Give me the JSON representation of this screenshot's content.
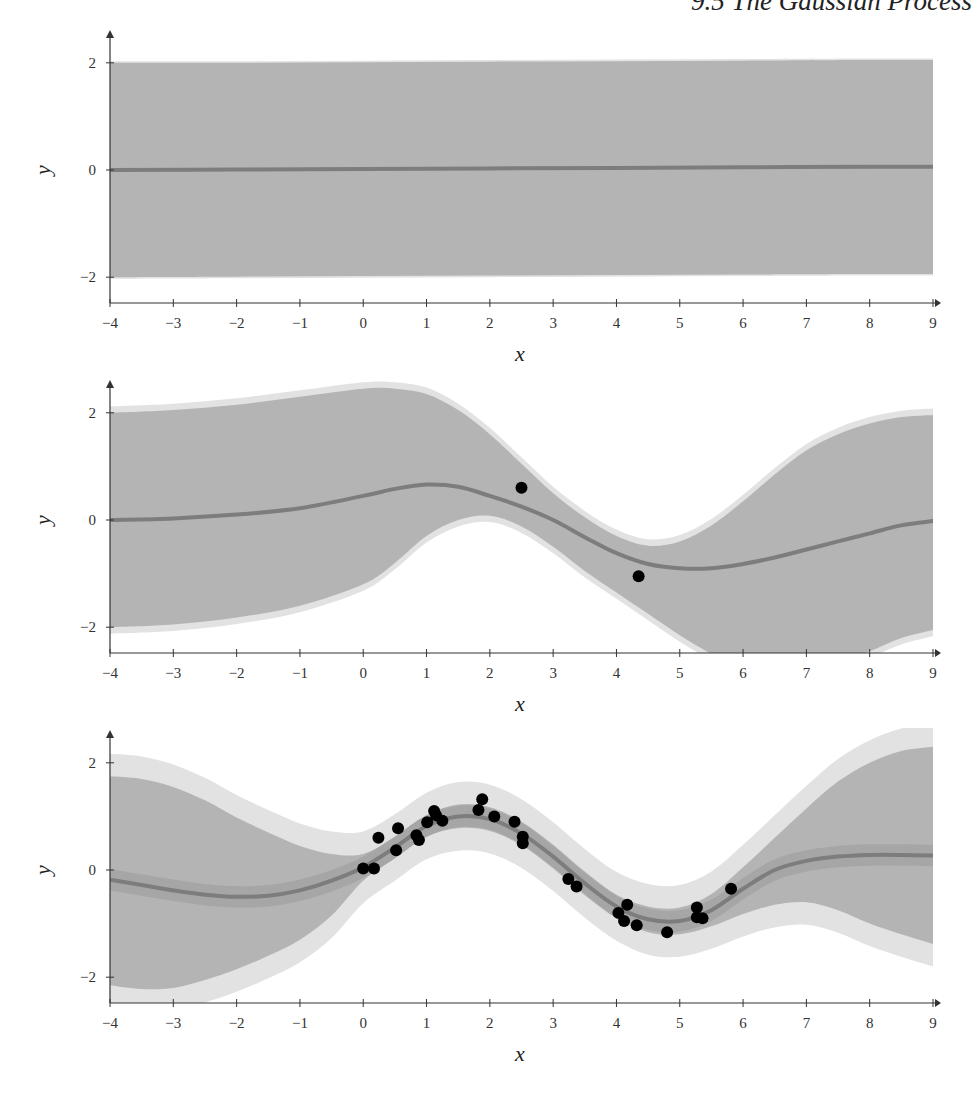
{
  "page": {
    "running_head": "9.5  The Gaussian Process"
  },
  "style": {
    "band_outer_color": "#e2e2e2",
    "band_inner_color": "#b4b4b4",
    "mean_color": "#7d7d7d",
    "point_color": "#000000",
    "axis_color": "#333333"
  },
  "chart_data": [
    {
      "type": "area",
      "title": "GP prior (no observations)",
      "xlabel": "x",
      "ylabel": "y",
      "xlim": [
        -4,
        9
      ],
      "ylim": [
        -2.4,
        2.5
      ],
      "xticks": [
        -4,
        -3,
        -2,
        -1,
        0,
        1,
        2,
        3,
        4,
        5,
        6,
        7,
        8,
        9
      ],
      "yticks": [
        -2,
        0,
        2
      ],
      "grid": false,
      "x": [
        -4,
        -2,
        0,
        2,
        4,
        6,
        8,
        9
      ],
      "mean": [
        0.0,
        0.01,
        0.02,
        0.03,
        0.04,
        0.05,
        0.06,
        0.06
      ],
      "upper": [
        2.0,
        2.0,
        2.01,
        2.02,
        2.03,
        2.04,
        2.05,
        2.05
      ],
      "lower": [
        -2.0,
        -1.99,
        -1.98,
        -1.97,
        -1.96,
        -1.95,
        -1.94,
        -1.94
      ],
      "outer_pad": 0.03,
      "inner_pad": 0.0,
      "points": []
    },
    {
      "type": "area",
      "title": "GP posterior (2 observations)",
      "xlabel": "x",
      "ylabel": "y",
      "xlim": [
        -4,
        9
      ],
      "ylim": [
        -2.4,
        2.5
      ],
      "xticks": [
        -4,
        -3,
        -2,
        -1,
        0,
        1,
        2,
        3,
        4,
        5,
        6,
        7,
        8,
        9
      ],
      "yticks": [
        -2,
        0,
        2
      ],
      "grid": false,
      "x": [
        -4,
        -3,
        -2,
        -1,
        0,
        0.5,
        1,
        1.5,
        2,
        2.5,
        3,
        3.5,
        4,
        4.5,
        5,
        5.5,
        6,
        6.5,
        7,
        7.5,
        8,
        8.5,
        9
      ],
      "mean": [
        0.0,
        0.03,
        0.1,
        0.22,
        0.45,
        0.58,
        0.66,
        0.62,
        0.45,
        0.25,
        0.0,
        -0.32,
        -0.62,
        -0.82,
        -0.9,
        -0.9,
        -0.82,
        -0.7,
        -0.55,
        -0.4,
        -0.25,
        -0.1,
        -0.02
      ],
      "upper": [
        2.0,
        2.05,
        2.15,
        2.3,
        2.45,
        2.45,
        2.35,
        2.05,
        1.6,
        1.05,
        0.5,
        0.05,
        -0.3,
        -0.48,
        -0.4,
        -0.1,
        0.35,
        0.85,
        1.3,
        1.6,
        1.8,
        1.92,
        1.96
      ],
      "lower": [
        -2.0,
        -1.95,
        -1.82,
        -1.6,
        -1.2,
        -0.8,
        -0.3,
        0.0,
        0.08,
        -0.12,
        -0.5,
        -0.95,
        -1.35,
        -1.75,
        -2.15,
        -2.5,
        -2.8,
        -2.95,
        -2.9,
        -2.7,
        -2.45,
        -2.2,
        -2.05
      ],
      "outer_pad": 0.12,
      "inner_pad": 0.0,
      "points": [
        {
          "x": 2.5,
          "y": 0.6
        },
        {
          "x": 4.35,
          "y": -1.05
        }
      ]
    },
    {
      "type": "area",
      "title": "GP posterior (many observations)",
      "xlabel": "x",
      "ylabel": "y",
      "xlim": [
        -4,
        9
      ],
      "ylim": [
        -2.4,
        2.5
      ],
      "xticks": [
        -4,
        -3,
        -2,
        -1,
        0,
        1,
        2,
        3,
        4,
        5,
        6,
        7,
        8,
        9
      ],
      "yticks": [
        -2,
        0,
        2
      ],
      "grid": false,
      "x": [
        -4,
        -3.5,
        -3,
        -2.5,
        -2,
        -1.5,
        -1,
        -0.5,
        0,
        0.5,
        1,
        1.5,
        2,
        2.5,
        3,
        3.5,
        4,
        4.5,
        5,
        5.5,
        6,
        6.5,
        7,
        7.5,
        8,
        8.5,
        9
      ],
      "mean": [
        -0.18,
        -0.28,
        -0.38,
        -0.46,
        -0.5,
        -0.48,
        -0.38,
        -0.2,
        0.05,
        0.42,
        0.82,
        1.0,
        0.95,
        0.68,
        0.25,
        -0.25,
        -0.68,
        -0.92,
        -0.95,
        -0.75,
        -0.35,
        0.0,
        0.17,
        0.25,
        0.28,
        0.28,
        0.27
      ],
      "upper": [
        1.75,
        1.7,
        1.55,
        1.3,
        0.98,
        0.7,
        0.45,
        0.3,
        0.3,
        0.62,
        1.02,
        1.22,
        1.17,
        0.9,
        0.47,
        -0.03,
        -0.46,
        -0.68,
        -0.7,
        -0.45,
        0.05,
        0.6,
        1.15,
        1.65,
        2.0,
        2.22,
        2.3
      ],
      "lower": [
        -2.15,
        -2.22,
        -2.2,
        -2.05,
        -1.85,
        -1.6,
        -1.3,
        -0.85,
        -0.2,
        0.22,
        0.62,
        0.78,
        0.73,
        0.46,
        0.03,
        -0.47,
        -0.9,
        -1.16,
        -1.2,
        -1.05,
        -0.82,
        -0.65,
        -0.6,
        -0.75,
        -1.0,
        -1.2,
        -1.38
      ],
      "outer_pad": 0.42,
      "inner_pad": 0.0,
      "points": [
        {
          "x": 0.0,
          "y": 0.03
        },
        {
          "x": 0.17,
          "y": 0.03
        },
        {
          "x": 0.24,
          "y": 0.6
        },
        {
          "x": 0.52,
          "y": 0.37
        },
        {
          "x": 0.55,
          "y": 0.78
        },
        {
          "x": 0.84,
          "y": 0.65
        },
        {
          "x": 0.88,
          "y": 0.56
        },
        {
          "x": 1.01,
          "y": 0.89
        },
        {
          "x": 1.12,
          "y": 1.1
        },
        {
          "x": 1.15,
          "y": 1.02
        },
        {
          "x": 1.25,
          "y": 0.92
        },
        {
          "x": 1.82,
          "y": 1.12
        },
        {
          "x": 1.88,
          "y": 1.32
        },
        {
          "x": 2.07,
          "y": 1.0
        },
        {
          "x": 2.39,
          "y": 0.9
        },
        {
          "x": 2.52,
          "y": 0.62
        },
        {
          "x": 2.52,
          "y": 0.5
        },
        {
          "x": 3.24,
          "y": -0.17
        },
        {
          "x": 3.37,
          "y": -0.31
        },
        {
          "x": 4.03,
          "y": -0.8
        },
        {
          "x": 4.17,
          "y": -0.65
        },
        {
          "x": 4.12,
          "y": -0.95
        },
        {
          "x": 4.32,
          "y": -1.03
        },
        {
          "x": 4.8,
          "y": -1.16
        },
        {
          "x": 5.27,
          "y": -0.7
        },
        {
          "x": 5.27,
          "y": -0.88
        },
        {
          "x": 5.36,
          "y": -0.9
        },
        {
          "x": 5.81,
          "y": -0.35
        }
      ]
    }
  ]
}
